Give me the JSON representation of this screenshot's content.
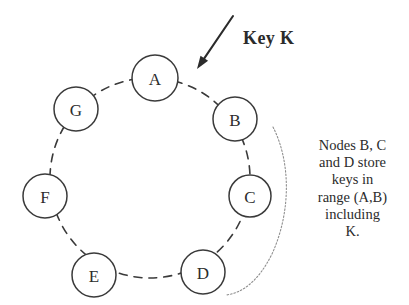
{
  "diagram": {
    "type": "ring-network-diagram",
    "background_color": "#ffffff",
    "stroke_color": "#3a3a3a",
    "ring": {
      "center_x": 150,
      "center_y": 178,
      "radius": 100,
      "style": "dashed"
    },
    "nodes": [
      {
        "label": "A",
        "cx": 155,
        "cy": 78,
        "r": 23
      },
      {
        "label": "B",
        "cx": 235,
        "cy": 119,
        "r": 22
      },
      {
        "label": "C",
        "cx": 250,
        "cy": 196,
        "r": 21
      },
      {
        "label": "D",
        "cx": 203,
        "cy": 272,
        "r": 22
      },
      {
        "label": "E",
        "cx": 94,
        "cy": 275,
        "r": 22
      },
      {
        "label": "F",
        "cx": 45,
        "cy": 196,
        "r": 22
      },
      {
        "label": "G",
        "cx": 76,
        "cy": 109,
        "r": 22
      }
    ],
    "arrow": {
      "name": "key-pointer-arrow",
      "x1": 233,
      "y1": 16,
      "x2": 197,
      "y2": 69
    },
    "key_label": {
      "text": "Key K",
      "x": 243,
      "y": 28
    },
    "bracket": {
      "name": "range-bracket",
      "path": "M 273 127 C 290 160, 292 210, 272 254 C 258 282, 242 293, 226 295"
    },
    "caption": {
      "x": 300,
      "y": 137,
      "width": 105,
      "lines": [
        "Nodes B, C",
        "and D store",
        "keys in",
        "range (A,B)",
        "including",
        "K."
      ]
    }
  }
}
